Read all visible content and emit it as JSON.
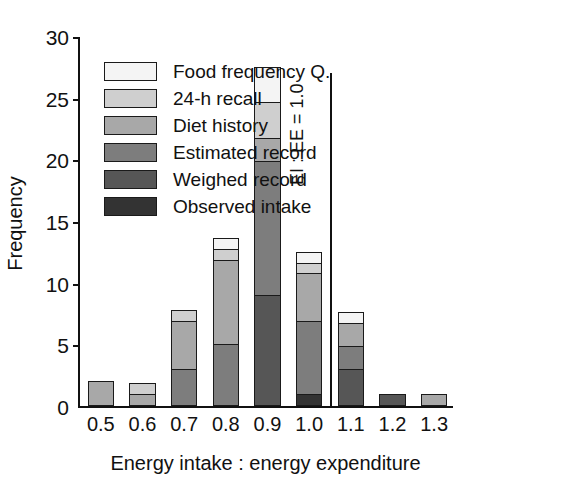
{
  "chart_data": {
    "type": "bar",
    "title": "",
    "subtitle": "",
    "stacked": true,
    "xlabel": "Energy intake : energy expenditure",
    "ylabel": "Frequency",
    "xtick_labels": [
      "0.5",
      "0.6",
      "0.7",
      "0.8",
      "0.9",
      "1.0",
      "1.1",
      "1.2",
      "1.3"
    ],
    "categories": [
      0.5,
      0.6,
      0.7,
      0.8,
      0.9,
      1.0,
      1.1,
      1.2,
      1.3
    ],
    "ytick_labels": [
      "0",
      "5",
      "10",
      "15",
      "20",
      "25",
      "30"
    ],
    "ylim": [
      0,
      30
    ],
    "ytick_step": 5,
    "grid": false,
    "legend_position": "top-left",
    "series": [
      {
        "name": "Food frequency Q.",
        "color": "#f4f4f4",
        "values": [
          0,
          0,
          0,
          1,
          3,
          1,
          1,
          0,
          0
        ]
      },
      {
        "name": "24-h recall",
        "color": "#cfcfcf",
        "values": [
          0,
          1,
          1,
          1,
          3,
          1,
          0,
          0,
          0
        ]
      },
      {
        "name": "Diet history",
        "color": "#a8a8a8",
        "values": [
          2,
          1,
          4,
          7,
          2,
          4,
          2,
          0,
          1
        ]
      },
      {
        "name": "Estimated record",
        "color": "#7d7d7d",
        "values": [
          0,
          0,
          3,
          5,
          11,
          6,
          2,
          0,
          0
        ]
      },
      {
        "name": "Weighed record",
        "color": "#565656",
        "values": [
          0,
          0,
          0,
          0,
          9,
          0,
          3,
          1,
          0
        ]
      },
      {
        "name": "Observed intake",
        "color": "#333333",
        "values": [
          0,
          0,
          0,
          0,
          0,
          1,
          0,
          0,
          0
        ]
      }
    ],
    "totals": [
      2,
      2,
      8,
      14,
      28,
      13,
      8,
      1,
      1
    ],
    "annotations": [
      {
        "name": "reference-line",
        "text": "EI : EE = 1.0",
        "x": 1.05,
        "y_top": 27,
        "orientation": "vertical"
      }
    ]
  }
}
